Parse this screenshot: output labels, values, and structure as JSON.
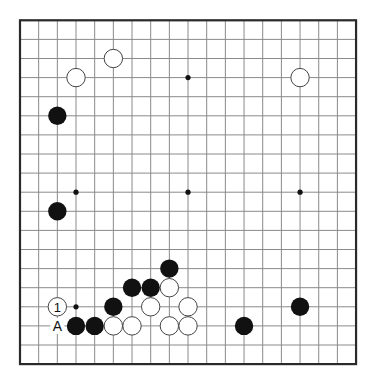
{
  "board": {
    "size": 19,
    "origin_x": 20,
    "origin_y": 20.3,
    "spacing_x": 18.67,
    "spacing_y": 19.1,
    "stone_radius": 9.2,
    "colors": {
      "grid": "#8a8a8a",
      "border": "#2a2a2a",
      "black": "#111111",
      "white": "#ffffff"
    },
    "star_points": [
      [
        3,
        3
      ],
      [
        9,
        3
      ],
      [
        15,
        3
      ],
      [
        3,
        9
      ],
      [
        9,
        9
      ],
      [
        15,
        9
      ],
      [
        3,
        15
      ],
      [
        9,
        15
      ],
      [
        15,
        15
      ]
    ],
    "stones": [
      {
        "color": "white",
        "col": 5,
        "row": 2
      },
      {
        "color": "white",
        "col": 3,
        "row": 3
      },
      {
        "color": "white",
        "col": 15,
        "row": 3
      },
      {
        "color": "black",
        "col": 2,
        "row": 5
      },
      {
        "color": "black",
        "col": 2,
        "row": 10
      },
      {
        "color": "black",
        "col": 8,
        "row": 13
      },
      {
        "color": "black",
        "col": 6,
        "row": 14
      },
      {
        "color": "black",
        "col": 7,
        "row": 14
      },
      {
        "color": "white",
        "col": 8,
        "row": 14
      },
      {
        "color": "white",
        "col": 2,
        "row": 15,
        "label": "1"
      },
      {
        "color": "black",
        "col": 5,
        "row": 15
      },
      {
        "color": "white",
        "col": 7,
        "row": 15
      },
      {
        "color": "white",
        "col": 9,
        "row": 15
      },
      {
        "color": "black",
        "col": 15,
        "row": 15
      },
      {
        "color": "black",
        "col": 3,
        "row": 16
      },
      {
        "color": "black",
        "col": 4,
        "row": 16
      },
      {
        "color": "white",
        "col": 5,
        "row": 16
      },
      {
        "color": "white",
        "col": 6,
        "row": 16
      },
      {
        "color": "white",
        "col": 8,
        "row": 16
      },
      {
        "color": "white",
        "col": 9,
        "row": 16
      },
      {
        "color": "black",
        "col": 12,
        "row": 16
      }
    ],
    "point_labels": [
      {
        "text": "A",
        "col": 2,
        "row": 16
      }
    ]
  }
}
